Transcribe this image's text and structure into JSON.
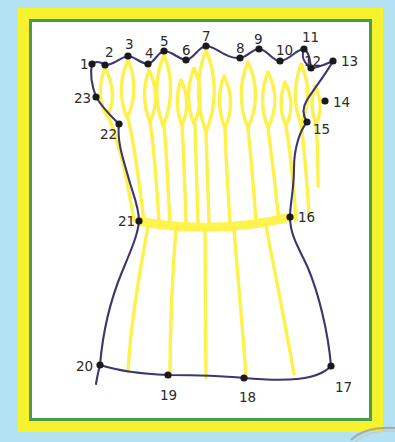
{
  "page": {
    "canvas": {
      "width": 395,
      "height": 442
    }
  },
  "colors": {
    "background_blue": "#b3e2f2",
    "frame_yellow": "#f6f22e",
    "frame_green": "#4d9a4d",
    "interior_white": "#ffffff",
    "outline_purple": "#3c3670",
    "fill_yellow": "#fdf14a",
    "band_yellow": "#fff34d",
    "dot_black": "#1a1a1a",
    "label_text": "#2b2b2b"
  },
  "drawing": {
    "type": "dot-to-dot-puzzle",
    "subject": "sheaf of wheat",
    "dot_count": 23,
    "dots": [
      {
        "n": 1,
        "label": "1",
        "x": 92,
        "y": 64,
        "lx": 80,
        "ly": 58
      },
      {
        "n": 2,
        "label": "2",
        "x": 105,
        "y": 65,
        "lx": 105,
        "ly": 46
      },
      {
        "n": 3,
        "label": "3",
        "x": 128,
        "y": 56,
        "lx": 125,
        "ly": 38
      },
      {
        "n": 4,
        "label": "4",
        "x": 148,
        "y": 64,
        "lx": 145,
        "ly": 47
      },
      {
        "n": 5,
        "label": "5",
        "x": 164,
        "y": 51,
        "lx": 160,
        "ly": 35
      },
      {
        "n": 6,
        "label": "6",
        "x": 186,
        "y": 60,
        "lx": 182,
        "ly": 44
      },
      {
        "n": 7,
        "label": "7",
        "x": 206,
        "y": 46,
        "lx": 202,
        "ly": 30
      },
      {
        "n": 8,
        "label": "8",
        "x": 240,
        "y": 58,
        "lx": 236,
        "ly": 42
      },
      {
        "n": 9,
        "label": "9",
        "x": 259,
        "y": 49,
        "lx": 254,
        "ly": 33
      },
      {
        "n": 10,
        "label": "10",
        "x": 280,
        "y": 61,
        "lx": 276,
        "ly": 44
      },
      {
        "n": 11,
        "label": "11",
        "x": 304,
        "y": 49,
        "lx": 302,
        "ly": 31
      },
      {
        "n": 12,
        "label": "12",
        "x": 311,
        "y": 68,
        "lx": 304,
        "ly": 55
      },
      {
        "n": 13,
        "label": "13",
        "x": 333,
        "y": 61,
        "lx": 341,
        "ly": 55
      },
      {
        "n": 14,
        "label": "14",
        "x": 325,
        "y": 101,
        "lx": 333,
        "ly": 96
      },
      {
        "n": 15,
        "label": "15",
        "x": 307,
        "y": 122,
        "lx": 313,
        "ly": 123
      },
      {
        "n": 16,
        "label": "16",
        "x": 290,
        "y": 217,
        "lx": 298,
        "ly": 211
      },
      {
        "n": 17,
        "label": "17",
        "x": 331,
        "y": 366,
        "lx": 335,
        "ly": 381
      },
      {
        "n": 18,
        "label": "18",
        "x": 244,
        "y": 378,
        "lx": 239,
        "ly": 391
      },
      {
        "n": 19,
        "label": "19",
        "x": 168,
        "y": 375,
        "lx": 160,
        "ly": 389
      },
      {
        "n": 20,
        "label": "20",
        "x": 100,
        "y": 365,
        "lx": 76,
        "ly": 360
      },
      {
        "n": 21,
        "label": "21",
        "x": 139,
        "y": 221,
        "lx": 118,
        "ly": 215
      },
      {
        "n": 22,
        "label": "22",
        "x": 119,
        "y": 124,
        "lx": 100,
        "ly": 128
      },
      {
        "n": 23,
        "label": "23",
        "x": 96,
        "y": 97,
        "lx": 74,
        "ly": 92
      }
    ],
    "outline_path": "M92,64 L105,65 L128,56 L148,64 L164,51 L186,60 L206,46 L240,58 L259,49 L280,61 L304,49 L311,68 L333,61",
    "feature_notes": {
      "top_edge": "wavy purple line connecting dots 1 through 13 across the top",
      "right_edge": "purple curve from 13 down through 14, 15, 16 to 17",
      "bottom_edge": "purple curve from 17 left through 18, 19 to 20",
      "left_edge": "purple curve from 20 up through 21, 22, 23 back to 1",
      "interior": "yellow pointed leaf/flame shapes at top, yellow vertical stalk lines through the body, a horizontal yellow binding band from dot 21 to dot 16"
    }
  }
}
